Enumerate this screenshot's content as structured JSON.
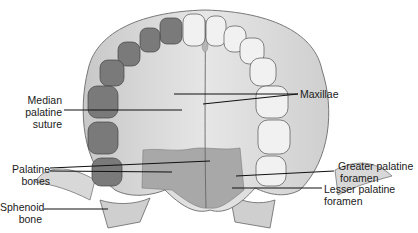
{
  "diagram": {
    "colors": {
      "background": "#ffffff",
      "bone_light": "#e4e4e4",
      "bone_mid": "#c9c9c9",
      "palatine_bone": "#a9a9a9",
      "tooth_light": "#f1f1f1",
      "tooth_dark": "#6d6d6d",
      "leader_line": "#111111",
      "label_text": "#1a1a1a"
    },
    "labels": {
      "median_palatine_suture": [
        "Median",
        "palatine",
        "suture"
      ],
      "palatine_bones": [
        "Palatine",
        "bones"
      ],
      "sphenoid_bone": [
        "Sphenoid",
        "bone"
      ],
      "maxillae": [
        "Maxillae"
      ],
      "greater_palatine_foramen": [
        "Greater palatine",
        "foramen"
      ],
      "lesser_palatine_foramen": [
        "Lesser palatine",
        "foramen"
      ]
    }
  }
}
